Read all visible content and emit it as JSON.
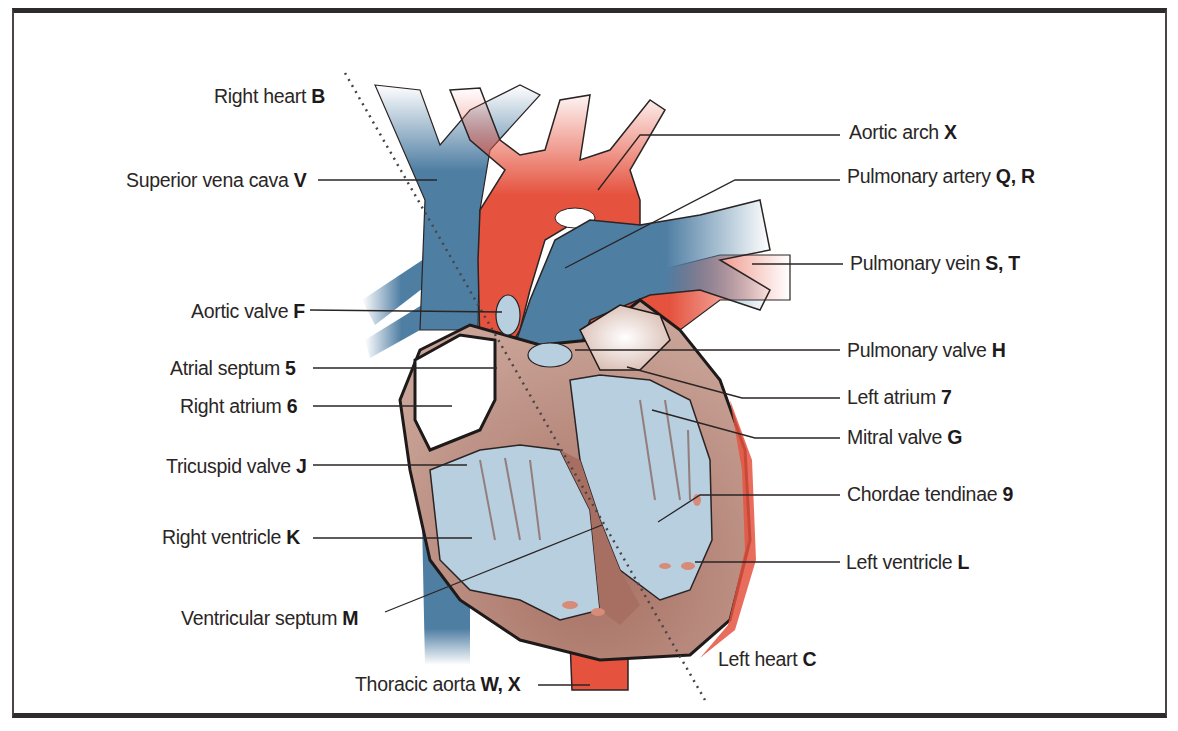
{
  "diagram": {
    "type": "anatomical-illustration",
    "colors": {
      "deoxygenated_vessel": "#4f7ea3",
      "oxygenated_vessel": "#e5533f",
      "myocardium": "#b98a7b",
      "chamber_interior": "#b8cfe0",
      "frame_border": "#2f2a2c",
      "label_text": "#2a2626"
    },
    "divider": {
      "style": "dotted",
      "from_label": "Right heart",
      "to_label": "Left heart"
    }
  },
  "labels": {
    "right_heart": {
      "text": "Right heart",
      "key": "B"
    },
    "left_heart": {
      "text": "Left heart",
      "key": "C"
    },
    "left_side": [
      {
        "text": "Superior vena cava",
        "key": "V"
      },
      {
        "text": "Aortic valve",
        "key": "F"
      },
      {
        "text": "Atrial septum",
        "key": "5"
      },
      {
        "text": "Right atrium",
        "key": "6"
      },
      {
        "text": "Tricuspid valve",
        "key": "J"
      },
      {
        "text": "Right ventricle",
        "key": "K"
      },
      {
        "text": "Ventricular septum",
        "key": "M"
      },
      {
        "text": "Thoracic aorta",
        "key": "W, X"
      }
    ],
    "right_side": [
      {
        "text": "Aortic arch",
        "key": "X"
      },
      {
        "text": "Pulmonary artery",
        "key": "Q, R"
      },
      {
        "text": "Pulmonary vein",
        "key": "S, T"
      },
      {
        "text": "Pulmonary valve",
        "key": "H"
      },
      {
        "text": "Left atrium",
        "key": "7"
      },
      {
        "text": "Mitral valve",
        "key": "G"
      },
      {
        "text": "Chordae tendinae",
        "key": "9"
      },
      {
        "text": "Left ventricle",
        "key": "L"
      }
    ]
  }
}
